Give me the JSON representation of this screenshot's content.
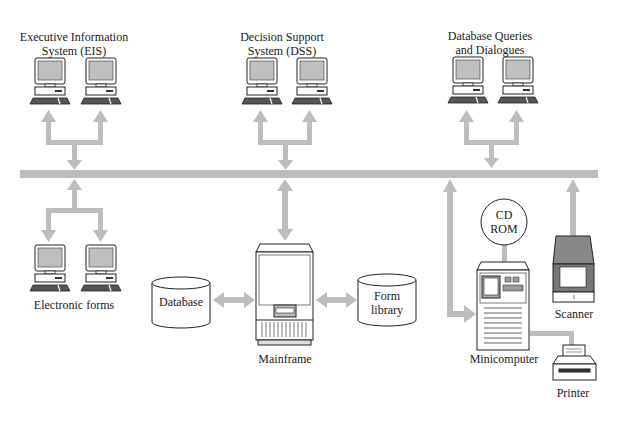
{
  "diagram": {
    "colors": {
      "connector": "#bdbdbd",
      "outline": "#222222",
      "screen": "#bfbfbf",
      "keyboard": "#555555",
      "background": "#ffffff"
    },
    "groups": {
      "eis": {
        "label_line1": "Executive Information",
        "label_line2": "System (EIS)"
      },
      "dss": {
        "label_line1": "Decision Support",
        "label_line2": "System (DSS)"
      },
      "dbq": {
        "label_line1": "Database Queries",
        "label_line2": "and Dialogues"
      },
      "forms": {
        "label": "Electronic forms"
      }
    },
    "nodes": {
      "database": {
        "label": "Database"
      },
      "mainframe": {
        "label": "Mainframe"
      },
      "form_library": {
        "label_line1": "Form",
        "label_line2": "library"
      },
      "cdrom": {
        "label_line1": "CD",
        "label_line2": "ROM"
      },
      "minicomputer": {
        "label": "Minicomputer"
      },
      "scanner": {
        "label": "Scanner"
      },
      "printer": {
        "label": "Printer"
      }
    }
  }
}
